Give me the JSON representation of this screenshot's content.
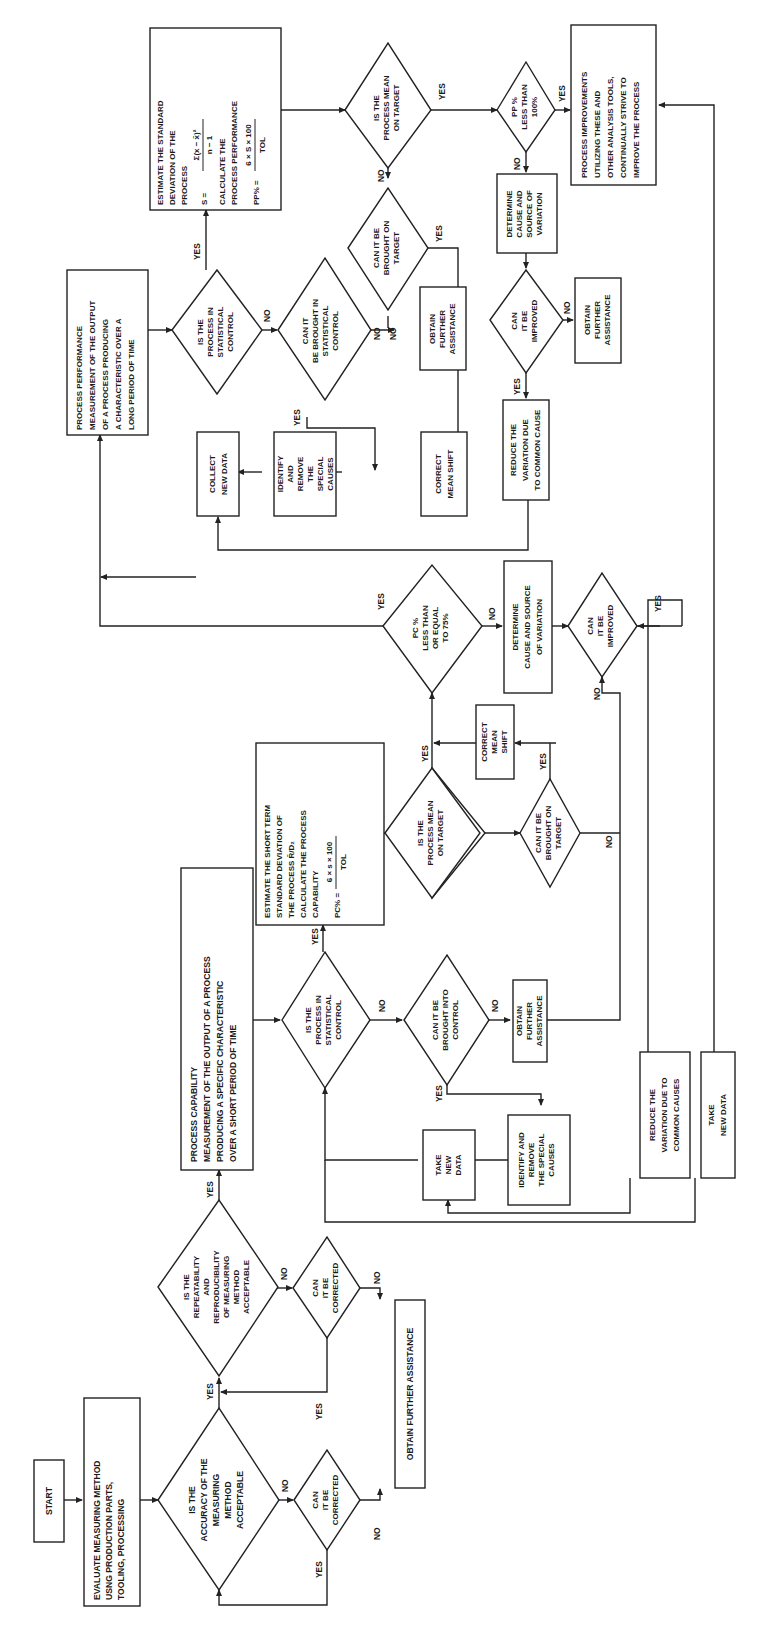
{
  "diagram": {
    "orientation": "rotated-90-ccw",
    "nodes": {
      "start": {
        "lines": [
          "START"
        ]
      },
      "evaluate": {
        "lines": [
          "EVALUATE MEASURING METHOD",
          "USNG PRODUCTION PARTS,",
          "TOOLING, PROCESSING"
        ]
      },
      "accuracy": {
        "lines": [
          "IS THE",
          "ACCURACY OF THE",
          "MEASURING",
          "METHOD",
          "ACCEPTABLE"
        ]
      },
      "can_correct_1": {
        "lines": [
          "CAN",
          "IT BE",
          "CORRECTED"
        ]
      },
      "repeatability": {
        "lines": [
          "IS THE",
          "REPEATABILITY",
          "AND",
          "REPRODUCIBILITY",
          "OF MEASURING",
          "METHOD",
          "ACCEPTABLE"
        ]
      },
      "can_correct_2": {
        "lines": [
          "CAN",
          "IT BE",
          "CORRECTED"
        ]
      },
      "obtain_assist_main": {
        "lines": [
          "OBTAIN FURTHER ASSISTANCE"
        ]
      },
      "capability": {
        "lines": [
          "PROCESS CAPABILITY",
          "MEASUREMENT OF THE OUTPUT OF A PROCESS",
          "PRODUCING A SPECIFIC CHARACTERISTIC",
          "OVER A SHORT PERIOD OF TIME"
        ]
      },
      "pc_in_control": {
        "lines": [
          "IS THE",
          "PROCESS IN",
          "STATISTICAL",
          "CONTROL"
        ]
      },
      "pc_brought_control": {
        "lines": [
          "CAN IT BE",
          "BROUGHT INTO",
          "CONTROL"
        ]
      },
      "pc_obtain_assist": {
        "lines": [
          "OBTAIN",
          "FURTHER",
          "ASSISTANCE"
        ]
      },
      "pc_identify": {
        "lines": [
          "IDENTIFY AND",
          "REMOVE",
          "THE SPECIAL",
          "CAUSES"
        ]
      },
      "pc_take_new_data": {
        "lines": [
          "TAKE",
          "NEW",
          "DATA"
        ]
      },
      "pc_estimate": {
        "lines": [
          "ESTIMATE THE SHORT TERM",
          "STANDARD DEVIATION OF",
          "THE PROCESS  R̄/D₂",
          "CALCULATE THE PROCESS",
          "CAPABILITY"
        ],
        "formula": {
          "lhs": "PC% =",
          "numerator": "6 × s × 100",
          "denominator": "TOL"
        }
      },
      "pc_mean_target": {
        "lines": [
          "IS THE",
          "PROCESS MEAN",
          "ON TARGET"
        ]
      },
      "pc_brought_target": {
        "lines": [
          "CAN IT BE",
          "BROUGHT ON",
          "TARGET"
        ]
      },
      "pc_correct_mean": {
        "lines": [
          "CORRECT",
          "MEAN",
          "SHIFT"
        ]
      },
      "pc_le_75": {
        "lines": [
          "PC %",
          "LESS THAN",
          "OR EQUAL",
          "TO 75%"
        ]
      },
      "pc_determine": {
        "lines": [
          "DETERMINE",
          "CAUSE AND SOURCE",
          "OF VARIATION"
        ]
      },
      "pc_improved": {
        "lines": [
          "CAN",
          "IT BE",
          "IMPROVED"
        ]
      },
      "pc_reduce": {
        "lines": [
          "REDUCE THE",
          "VARIATION DUE TO",
          "COMMON CAUSES"
        ]
      },
      "take_new_data_2": {
        "lines": [
          "TAKE",
          "NEW DATA"
        ]
      },
      "performance": {
        "lines": [
          "PROCESS PERFORMANCE",
          "MEASUREMENT OF THE OUTPUT",
          "OF A PROCESS PRODUCING",
          "A CHARACTERISTIC OVER A",
          "LONG PERIOD OF TIME"
        ]
      },
      "pp_in_control": {
        "lines": [
          "IS THE",
          "PROCESS IN",
          "STATISTICAL",
          "CONTROL"
        ]
      },
      "pp_brought_control": {
        "lines": [
          "CAN IT",
          "BE BROUGHT IN",
          "STATISTICAL",
          "CONTROL"
        ]
      },
      "pp_obtain_assist_1": {
        "lines": [
          "OBTAIN",
          "FURTHER",
          "ASSISTANCE"
        ]
      },
      "pp_identify": {
        "lines": [
          "IDENTIFY",
          "AND",
          "REMOVE",
          "THE",
          "SPECIAL",
          "CAUSES"
        ]
      },
      "pp_collect": {
        "lines": [
          "COLLECT",
          "NEW DATA"
        ]
      },
      "pp_estimate": {
        "lines": [
          "ESTIMATE THE STANDARD",
          "DEVIATION OF THE",
          "PROCESS"
        ],
        "s_formula": {
          "lhs": "S =",
          "numerator": "Σ(x − x̄)²",
          "denominator": "n − 1"
        },
        "lines2": [
          "CALCULATE THE",
          "PROCESS PERFORMANCE"
        ],
        "formula": {
          "lhs": "PP% =",
          "numerator": "6 × S × 100",
          "denominator": "TOL"
        }
      },
      "pp_mean_target": {
        "lines": [
          "IS THE",
          "PROCESS MEAN",
          "ON TARGET"
        ]
      },
      "pp_brought_target": {
        "lines": [
          "CAN IT BE",
          "BROUGHT ON",
          "TARGET"
        ]
      },
      "pp_correct_mean": {
        "lines": [
          "CORRECT",
          "MEAN SHIFT"
        ]
      },
      "pp_less_100": {
        "lines": [
          "PP %",
          "LESS THAN",
          "100%"
        ]
      },
      "pp_determine": {
        "lines": [
          "DETERMINE",
          "CAUSE AND",
          "SOURCE OF",
          "VARIATION"
        ]
      },
      "pp_improved": {
        "lines": [
          "CAN",
          "IT BE",
          "IMPROVED"
        ]
      },
      "pp_obtain_assist_2": {
        "lines": [
          "OBTAIN",
          "FURTHER",
          "ASSISTANCE"
        ]
      },
      "pp_reduce": {
        "lines": [
          "REDUCE THE",
          "VARIATION DUE",
          "TO COMMON CAUSE"
        ]
      },
      "improvements": {
        "lines": [
          "PROCESS IMPROVEMENTS",
          "UTILIZING THESE AND",
          "OTHER ANALYSIS TOOLS,",
          "CONTINUALLY STRIVE TO",
          "IMPROVE THE PROCESS"
        ]
      }
    },
    "edge_labels": {
      "yes": "YES",
      "no": "NO"
    }
  }
}
